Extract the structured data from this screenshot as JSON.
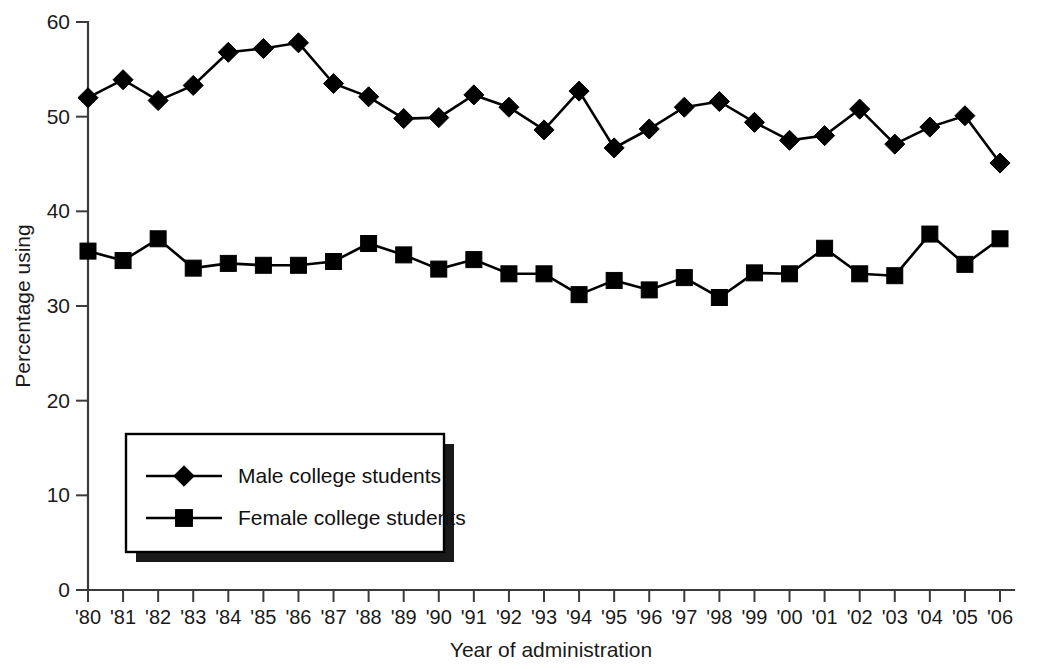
{
  "chart_data": {
    "type": "line",
    "title": "",
    "subtitle": "",
    "xlabel": "Year of administration",
    "ylabel": "Percentage using",
    "xlim": [
      1980,
      2006
    ],
    "ylim": [
      0,
      60
    ],
    "grid": false,
    "legend_position": "inside-lower-left",
    "x": [
      1980,
      1981,
      1982,
      1983,
      1984,
      1985,
      1986,
      1987,
      1988,
      1989,
      1990,
      1991,
      1992,
      1993,
      1994,
      1995,
      1996,
      1997,
      1998,
      1999,
      2000,
      2001,
      2002,
      2003,
      2004,
      2005,
      2006
    ],
    "categories": [
      "'80",
      "'81",
      "'82",
      "'83",
      "'84",
      "'85",
      "'86",
      "'87",
      "'88",
      "'89",
      "'90",
      "'91",
      "'92",
      "'93",
      "'94",
      "'95",
      "'96",
      "'97",
      "'98",
      "'99",
      "'00",
      "'01",
      "'02",
      "'03",
      "'04",
      "'05",
      "'06"
    ],
    "xticklabels": [
      "'80",
      "'81",
      "'82",
      "'83",
      "'84",
      "'85",
      "'86",
      "'87",
      "'88",
      "'89",
      "'90",
      "'91",
      "'92",
      "'93",
      "'94",
      "'95",
      "'96",
      "'97",
      "'98",
      "'99",
      "'00",
      "'01",
      "'02",
      "'03",
      "'04",
      "'05",
      "'06"
    ],
    "yticks": [
      0,
      10,
      20,
      30,
      40,
      50,
      60
    ],
    "yticklabels": [
      "0",
      "10",
      "20",
      "30",
      "40",
      "50",
      "60"
    ],
    "series": [
      {
        "name": "Male college students",
        "marker": "diamond",
        "values": [
          52.0,
          53.9,
          51.7,
          53.3,
          56.8,
          57.2,
          57.8,
          53.5,
          52.1,
          49.8,
          49.9,
          52.3,
          51.0,
          48.6,
          52.7,
          46.7,
          48.7,
          51.0,
          51.6,
          49.4,
          47.5,
          48.0,
          50.8,
          47.1,
          48.9,
          50.1,
          45.1
        ]
      },
      {
        "name": "Female college students",
        "marker": "square",
        "values": [
          35.8,
          34.8,
          37.1,
          34.0,
          34.5,
          34.3,
          34.3,
          34.7,
          36.6,
          35.4,
          33.9,
          34.9,
          33.4,
          33.4,
          31.2,
          32.7,
          31.7,
          33.0,
          30.9,
          33.5,
          33.4,
          36.1,
          33.4,
          33.2,
          37.6,
          34.4,
          37.1
        ]
      }
    ]
  },
  "legend": {
    "items": [
      {
        "label": "Male college students",
        "marker": "diamond-icon"
      },
      {
        "label": "Female college students",
        "marker": "square-icon"
      }
    ]
  },
  "axes": {
    "y_title": "Percentage using",
    "x_title": "Year of administration"
  }
}
